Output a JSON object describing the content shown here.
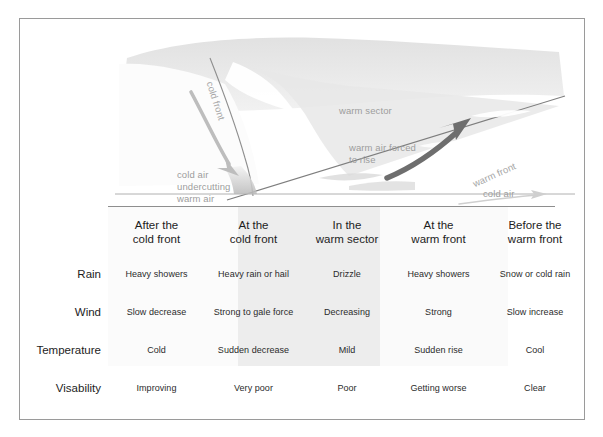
{
  "diagram": {
    "labels": {
      "cold_front": "cold front",
      "warm_sector": "warm sector",
      "warm_air_forced_to_rise_line1": "warm air forced",
      "warm_air_forced_to_rise_line2": "to rise",
      "cold_air_undercutting_line1": "cold air",
      "cold_air_undercutting_line2": "undercutting",
      "cold_air_undercutting_line3": "warm air",
      "warm_front": "warm front",
      "cold_air_right": "cold air"
    },
    "colors": {
      "label_gray": "#9d9d9d",
      "front_line": "#8f8f8f",
      "thick_arrow": "#6e6e6e",
      "air_mass_fill": "#e6e6e6",
      "ground": "#c9c9c9"
    }
  },
  "table": {
    "columns": [
      "",
      "After the\ncold front",
      "At the\ncold front",
      "In the\nwarm sector",
      "At the\nwarm front",
      "Before the\nwarm front"
    ],
    "headers": {
      "col0": "",
      "col1_line1": "After the",
      "col1_line2": "cold front",
      "col2_line1": "At the",
      "col2_line2": "cold front",
      "col3_line1": "In the",
      "col3_line2": "warm sector",
      "col4_line1": "At the",
      "col4_line2": "warm front",
      "col5_line1": "Before the",
      "col5_line2": "warm front"
    },
    "rows": [
      {
        "label": "Rain",
        "cells": [
          "Heavy showers",
          "Heavy rain or hail",
          "Drizzle",
          "Heavy showers",
          "Snow or cold rain"
        ]
      },
      {
        "label": "Wind",
        "cells": [
          "Slow decrease",
          "Strong to gale force",
          "Decreasing",
          "Strong",
          "Slow increase"
        ]
      },
      {
        "label": "Temperature",
        "cells": [
          "Cold",
          "Sudden decrease",
          "Mild",
          "Sudden rise",
          "Cool"
        ]
      },
      {
        "label": "Visability",
        "cells": [
          "Improving",
          "Very poor",
          "Poor",
          "Getting worse",
          "Clear"
        ]
      }
    ]
  }
}
